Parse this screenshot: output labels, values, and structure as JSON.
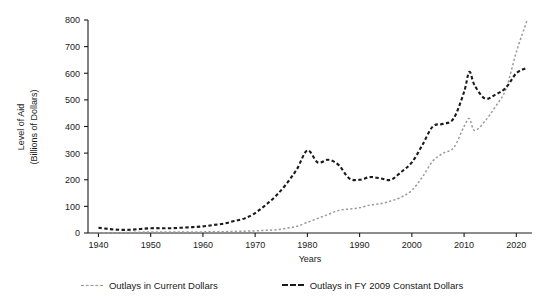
{
  "chart_data": {
    "type": "line",
    "title": "",
    "xlabel": "Years",
    "ylabel": "Level of Aid (Billions of Dollars)",
    "ylabel_line1": "Level of Aid",
    "ylabel_line2": "(Billions of Dollars)",
    "xlim": [
      1938,
      2023
    ],
    "ylim": [
      0,
      800
    ],
    "xticks": [
      1940,
      1950,
      1960,
      1970,
      1980,
      1990,
      2000,
      2010,
      2020
    ],
    "yticks": [
      0,
      100,
      200,
      300,
      400,
      500,
      600,
      700,
      800
    ],
    "grid": false,
    "legend_position": "bottom",
    "colors": {
      "current": "#9a9a9a",
      "constant": "#1a1a1a"
    },
    "series": [
      {
        "name": "Outlays in Current Dollars",
        "style": "dotted",
        "color": "#9a9a9a",
        "x": [
          1940,
          1942,
          1944,
          1946,
          1948,
          1950,
          1952,
          1954,
          1956,
          1958,
          1960,
          1962,
          1964,
          1966,
          1968,
          1970,
          1972,
          1974,
          1976,
          1978,
          1980,
          1982,
          1984,
          1986,
          1988,
          1990,
          1992,
          1994,
          1996,
          1998,
          2000,
          2002,
          2004,
          2006,
          2008,
          2010,
          2011,
          2012,
          2014,
          2016,
          2018,
          2020,
          2022
        ],
        "values": [
          1,
          1,
          1,
          2,
          3,
          4,
          4,
          4,
          4,
          4,
          4,
          5,
          5,
          6,
          7,
          8,
          10,
          12,
          18,
          25,
          40,
          55,
          70,
          85,
          90,
          95,
          105,
          110,
          120,
          135,
          160,
          210,
          270,
          300,
          320,
          400,
          430,
          385,
          420,
          475,
          540,
          680,
          795
        ]
      },
      {
        "name": "Outlays in FY 2009 Constant Dollars",
        "style": "dashed",
        "color": "#1a1a1a",
        "x": [
          1940,
          1942,
          1944,
          1946,
          1948,
          1950,
          1952,
          1954,
          1956,
          1958,
          1960,
          1962,
          1964,
          1966,
          1968,
          1970,
          1972,
          1974,
          1976,
          1978,
          1980,
          1982,
          1984,
          1986,
          1988,
          1990,
          1992,
          1994,
          1996,
          1998,
          2000,
          2002,
          2004,
          2006,
          2008,
          2010,
          2011,
          2012,
          2014,
          2016,
          2018,
          2020,
          2022
        ],
        "values": [
          20,
          15,
          12,
          12,
          15,
          18,
          18,
          18,
          20,
          22,
          25,
          30,
          35,
          45,
          55,
          75,
          105,
          140,
          185,
          240,
          310,
          265,
          275,
          255,
          205,
          200,
          210,
          205,
          200,
          230,
          265,
          330,
          400,
          410,
          430,
          530,
          605,
          555,
          505,
          520,
          545,
          600,
          620
        ]
      }
    ]
  },
  "legend": {
    "entries": [
      {
        "label": "Outlays in Current Dollars"
      },
      {
        "label": "Outlays in FY 2009 Constant Dollars"
      }
    ]
  }
}
